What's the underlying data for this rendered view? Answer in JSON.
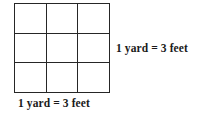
{
  "diagram": {
    "grid": {
      "rows": 3,
      "columns": 3,
      "cell_count": 9,
      "line_color": "#262626",
      "fill_color": "#ffffff"
    },
    "labels": {
      "right": "1 yard = 3 feet",
      "bottom": "1 yard = 3 feet"
    }
  }
}
